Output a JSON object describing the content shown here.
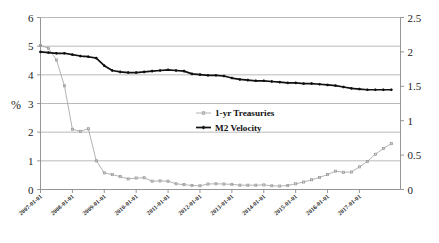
{
  "chart_data": {
    "type": "line",
    "title": "",
    "xlabel": "",
    "ylabel": "%",
    "ylabel_right": "",
    "grid": true,
    "legend_position": "center",
    "ylim": [
      0,
      6
    ],
    "ylim_right": [
      0,
      2.5
    ],
    "yticks": [
      "0",
      "1",
      "2",
      "3",
      "4",
      "5",
      "6"
    ],
    "yticks_right": [
      "0",
      "0.5",
      "1",
      "1.5",
      "2",
      "2.5"
    ],
    "xtick_labels": [
      "2007-01-01",
      "2008-01-01",
      "2009-01-01",
      "2010-01-01",
      "2011-01-01",
      "2012-01-01",
      "2013-01-01",
      "2014-01-01",
      "2015-01-01",
      "2016-01-01",
      "2017-01-01"
    ],
    "x_start": "2007-01-01",
    "x_end": "2017-10-01",
    "x_frequency": "quarterly",
    "series": [
      {
        "name": "1-yr Treasuries",
        "axis": "left",
        "color": "#9a9a9a",
        "marker": "square",
        "values": [
          5.02,
          4.93,
          4.52,
          3.62,
          2.1,
          2.03,
          2.12,
          1.0,
          0.58,
          0.52,
          0.45,
          0.37,
          0.4,
          0.41,
          0.29,
          0.3,
          0.29,
          0.2,
          0.17,
          0.14,
          0.13,
          0.19,
          0.2,
          0.19,
          0.18,
          0.15,
          0.15,
          0.15,
          0.16,
          0.13,
          0.12,
          0.14,
          0.2,
          0.26,
          0.34,
          0.42,
          0.52,
          0.64,
          0.6,
          0.61,
          0.79,
          0.98,
          1.23,
          1.43,
          1.6
        ]
      },
      {
        "name": "M2 Velocity",
        "axis": "right",
        "color": "#111111",
        "marker": "cross",
        "values": [
          2.0,
          1.99,
          1.98,
          1.98,
          1.96,
          1.94,
          1.93,
          1.91,
          1.8,
          1.73,
          1.71,
          1.7,
          1.7,
          1.71,
          1.72,
          1.73,
          1.74,
          1.73,
          1.72,
          1.68,
          1.67,
          1.66,
          1.66,
          1.65,
          1.62,
          1.6,
          1.59,
          1.58,
          1.58,
          1.57,
          1.56,
          1.55,
          1.55,
          1.54,
          1.54,
          1.53,
          1.52,
          1.51,
          1.49,
          1.47,
          1.46,
          1.45,
          1.45,
          1.45,
          1.45
        ]
      }
    ],
    "legend": [
      {
        "label": "1-yr Treasuries",
        "color": "#9a9a9a",
        "marker": "square"
      },
      {
        "label": "M2 Velocity",
        "color": "#111111",
        "marker": "cross"
      }
    ]
  }
}
